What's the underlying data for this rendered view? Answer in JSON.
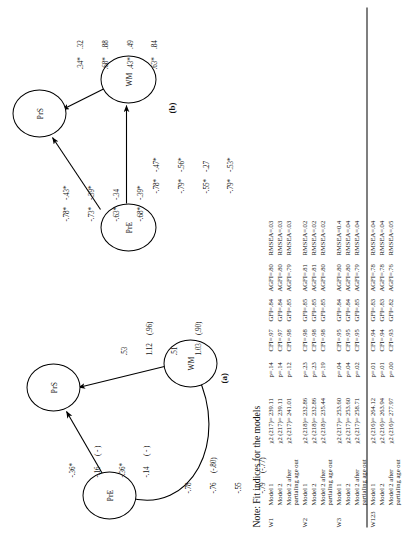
{
  "figure": {
    "panel_a": {
      "letter": "(a)",
      "nodes": [
        {
          "id": "PrE",
          "label": "PrE"
        },
        {
          "id": "PrS",
          "label": "PrS"
        },
        {
          "id": "WM",
          "label": "WM"
        }
      ],
      "paths": [
        {
          "name": "PrE-PrS",
          "from": "PrE",
          "to": "PrS",
          "col1": [
            "-.36*",
            "-.16",
            "-.36*",
            "-.14"
          ],
          "col2": [
            "",
            "( - )",
            "",
            "( - )"
          ]
        },
        {
          "name": "WM-PrS",
          "from": "WM",
          "to": "PrS",
          "col1": [
            ".53",
            "1.12",
            ".51",
            "1.03"
          ],
          "col2": [
            "",
            "(.96)",
            "",
            "(.90)"
          ]
        },
        {
          "name": "PrE-WM-correlation",
          "from": "PrE",
          "to": "WM",
          "col1": [
            "-.78",
            "-.76",
            "-.55",
            "-.79"
          ],
          "col2": [
            "",
            "(-.80)",
            "",
            "(-.77)"
          ]
        }
      ]
    },
    "panel_b": {
      "letter": "(b)",
      "nodes": [
        {
          "id": "PrE",
          "label": "PrE"
        },
        {
          "id": "PrS",
          "label": "PrS"
        },
        {
          "id": "WM",
          "label": "WM"
        }
      ],
      "paths": [
        {
          "name": "PrE-PrS",
          "from": "PrE",
          "to": "PrS",
          "col1": [
            "-.78*",
            "-.73*",
            "-.63*",
            "-.68*"
          ],
          "col2": [
            "-.43*",
            "-.39*",
            "-.34",
            "-.39*"
          ]
        },
        {
          "name": "PrE-WM",
          "from": "PrE",
          "to": "WM",
          "col1": [
            "-.78*",
            "-.79*",
            "-.55*",
            "-.79*"
          ],
          "col2": [
            "-.47*",
            "-.56*",
            "-.27",
            "-.53*"
          ]
        },
        {
          "name": "WM-PrS",
          "from": "WM",
          "to": "PrS",
          "col1": [
            ".34*",
            ".68*",
            ".43*",
            ".63*"
          ],
          "col2": [
            ".32",
            ".88",
            ".49",
            ".84"
          ]
        }
      ]
    }
  },
  "table": {
    "note": "Note: Fit indices for the models",
    "rows": [
      {
        "wave": "W1",
        "model": "Model 1",
        "chi": "χ2 (217)= 239.11",
        "p": "p=.14",
        "cfi": "CFI=.97",
        "gfi": "GFI=.84",
        "agfi": "AGFI=.80",
        "rmsea": "RMSEA=.03",
        "group_start": true
      },
      {
        "wave": "",
        "model": "Model 2",
        "chi": "χ2 (217)= 239.11",
        "p": "p=.14",
        "cfi": "CFI=.97",
        "gfi": "GFI=.84",
        "agfi": "AGFI=.80",
        "rmsea": "RMSEA=.03",
        "group_start": false
      },
      {
        "wave": "",
        "model": "Model 2 after partialing age out",
        "chi": "χ2 (217)= 241.01",
        "p": "p=.12",
        "cfi": "CFI=.98",
        "gfi": "GFI=.85",
        "agfi": "AGFI=.79",
        "rmsea": "RMSEA=.03",
        "group_start": false
      },
      {
        "wave": "W2",
        "model": "Model 1",
        "chi": "χ2 (218)= 232.86",
        "p": "p=.23",
        "cfi": "CFI=.98",
        "gfi": "GFI=.85",
        "agfi": "AGFI=.81",
        "rmsea": "RMSEA=.02",
        "group_start": true
      },
      {
        "wave": "",
        "model": "Model 2",
        "chi": "χ2 (218)= 232.86",
        "p": "p=.23",
        "cfi": "CFI=.98",
        "gfi": "GFI=.85",
        "agfi": "AGFI=.81",
        "rmsea": "RMSEA=.02",
        "group_start": false
      },
      {
        "wave": "",
        "model": "Model 2 after partialing age out",
        "chi": "χ2 (218)= 235.44",
        "p": "p=.19",
        "cfi": "CFI=.98",
        "gfi": "GFI=.85",
        "agfi": "AGFI=.80",
        "rmsea": "RMSEA=.02",
        "group_start": false
      },
      {
        "wave": "W3",
        "model": "Model 1",
        "chi": "χ2 (217)= 253.60",
        "p": "p=.04",
        "cfi": "CFI=.95",
        "gfi": "GFI=.84",
        "agfi": "AGFI=.80",
        "rmsea": "RMSEA=0.4",
        "group_start": true
      },
      {
        "wave": "",
        "model": "Model 2",
        "chi": "χ2 (217)= 253.60",
        "p": "p=.04",
        "cfi": "CFI=.95",
        "gfi": "GFI=.84",
        "agfi": "AGFI=.80",
        "rmsea": "RMSEA=.04",
        "group_start": false
      },
      {
        "wave": "",
        "model": "Model 2 after partialing age out",
        "chi": "χ2 (217)= 258.71",
        "p": "p=.02",
        "cfi": "CFI=.95",
        "gfi": "GFI=.85",
        "agfi": "AGFI=.79",
        "rmsea": "RMSEA=.04",
        "group_start": false
      },
      {
        "wave": "W123",
        "model": "Model 1",
        "chi": "χ2 (216)= 264.12",
        "p": "p=.01",
        "cfi": "CFI=.94",
        "gfi": "GFI=.83",
        "agfi": "AGFI=.78",
        "rmsea": "RMSEA=.04",
        "group_start": true
      },
      {
        "wave": "",
        "model": "Model 2",
        "chi": "χ2 (216)= 263.94",
        "p": "p=.01",
        "cfi": "CFI=.94",
        "gfi": "GFI=.83",
        "agfi": "AGFI=.78",
        "rmsea": "RMSEA=.04",
        "group_start": false
      },
      {
        "wave": "",
        "model": "Model 2 after partialing age out",
        "chi": "χ2 (216)= 277.97",
        "p": "p=.00",
        "cfi": "CFI=.93",
        "gfi": "GFI=.82",
        "agfi": "AGFI=.76",
        "rmsea": "RMSEA=.05",
        "group_start": false
      }
    ]
  }
}
